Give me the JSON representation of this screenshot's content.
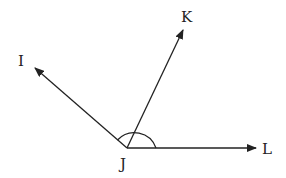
{
  "diagram": {
    "type": "angle-diagram",
    "vertex": {
      "label": "J",
      "x": 127,
      "y": 148
    },
    "rays": [
      {
        "label": "I",
        "end": {
          "x": 34,
          "y": 68
        }
      },
      {
        "label": "K",
        "end": {
          "x": 183,
          "y": 30
        }
      },
      {
        "label": "L",
        "end": {
          "x": 256,
          "y": 148
        }
      }
    ],
    "arc": {
      "radius": 30,
      "from": "JI",
      "to": "JL",
      "description": "angle IJL marked"
    },
    "colors": {
      "stroke": "#222222",
      "background": "#ffffff"
    }
  },
  "labels": {
    "i": "I",
    "j": "J",
    "k": "K",
    "l": "L"
  }
}
